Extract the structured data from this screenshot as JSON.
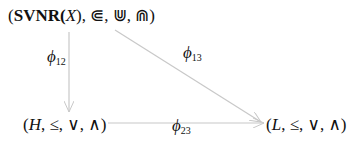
{
  "nodes": {
    "top": {
      "prefix": "(",
      "bold": "SVNR",
      "open": "(",
      "var": "X",
      "rest": "), ⋐, ⋓, ⋒)"
    },
    "bottom_left": {
      "open": "(",
      "var": "H",
      "rest": ", ≤, ∨, ∧)"
    },
    "bottom_right": {
      "open": "(",
      "var": "L",
      "rest": ", ≤, ∨, ∧)"
    }
  },
  "edges": [
    {
      "from": "top",
      "to": "bottom_left",
      "symbol": "ϕ",
      "index": "12"
    },
    {
      "from": "top",
      "to": "bottom_right",
      "symbol": "ϕ",
      "index": "13"
    },
    {
      "from": "bottom_left",
      "to": "bottom_right",
      "symbol": "ϕ",
      "index": "23"
    }
  ],
  "colors": {
    "arrow": "#c8c8c8",
    "text": "#111111"
  }
}
